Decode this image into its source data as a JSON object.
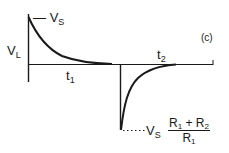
{
  "diagram": {
    "panel_label": "(c)",
    "y_axis_label": {
      "main": "V",
      "sub": "L"
    },
    "peak_label": {
      "dash": "—",
      "main": "V",
      "sub": "S"
    },
    "interval_1": {
      "main": "t",
      "sub": "1"
    },
    "interval_2": {
      "main": "t",
      "sub": "2"
    },
    "negative_peak_label": {
      "prefix": {
        "main": "V",
        "sub": "S"
      },
      "fraction": {
        "numerator": {
          "a": "R",
          "a_sub": "1",
          "op": " + ",
          "b": "R",
          "b_sub": "2"
        },
        "denominator": {
          "a": "R",
          "a_sub": "1"
        }
      }
    },
    "colors": {
      "line": "#1a1a1a",
      "background": "#ffffff"
    }
  }
}
